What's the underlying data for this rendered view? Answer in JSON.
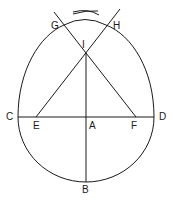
{
  "diagram": {
    "labels": {
      "G": "G",
      "H": "H",
      "I": "I",
      "C": "C",
      "D": "D",
      "E": "E",
      "A": "A",
      "F": "F",
      "B": "B"
    },
    "stroke_color": "#1a1a1a",
    "background": "#ffffff"
  }
}
